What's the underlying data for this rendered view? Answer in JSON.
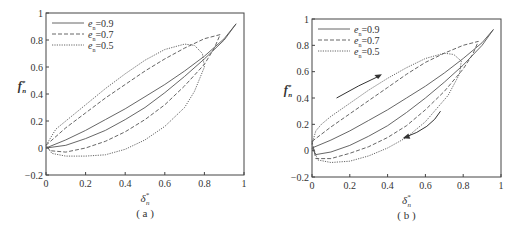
{
  "chart_data": [
    {
      "type": "line",
      "panel_label": "( a )",
      "xlabel": "δ*n",
      "ylabel": "f*n",
      "xlim": [
        0,
        1
      ],
      "ylim": [
        -0.2,
        1
      ],
      "xticks": [
        "0",
        "0.2",
        "0.4",
        "0.6",
        "0.8",
        "1"
      ],
      "yticks": [
        "-0.2",
        "0",
        "0.2",
        "0.4",
        "0.6",
        "0.8",
        "1"
      ],
      "legend_position": "upper left",
      "series": [
        {
          "name": "en=0.9",
          "style": "solid",
          "x": [
            0,
            0.1,
            0.2,
            0.3,
            0.4,
            0.5,
            0.6,
            0.7,
            0.8,
            0.9,
            0.96,
            0.9,
            0.8,
            0.7,
            0.6,
            0.5,
            0.4,
            0.3,
            0.2,
            0.1,
            0
          ],
          "y": [
            0,
            0.06,
            0.13,
            0.21,
            0.29,
            0.38,
            0.47,
            0.57,
            0.68,
            0.81,
            0.92,
            0.8,
            0.66,
            0.53,
            0.41,
            0.3,
            0.21,
            0.13,
            0.07,
            0.02,
            0
          ]
        },
        {
          "name": "en=0.7",
          "style": "dashed",
          "x": [
            0,
            0.1,
            0.2,
            0.3,
            0.4,
            0.5,
            0.6,
            0.7,
            0.8,
            0.88,
            0.85,
            0.8,
            0.7,
            0.6,
            0.5,
            0.4,
            0.3,
            0.2,
            0.1,
            0.02,
            0
          ],
          "y": [
            0.02,
            0.15,
            0.26,
            0.37,
            0.47,
            0.57,
            0.66,
            0.74,
            0.81,
            0.84,
            0.74,
            0.62,
            0.46,
            0.32,
            0.21,
            0.12,
            0.05,
            0,
            -0.03,
            -0.02,
            0.02
          ]
        },
        {
          "name": "en=0.5",
          "style": "dotted",
          "x": [
            0,
            0.05,
            0.1,
            0.2,
            0.3,
            0.4,
            0.5,
            0.6,
            0.7,
            0.75,
            0.79,
            0.8,
            0.75,
            0.7,
            0.6,
            0.5,
            0.4,
            0.3,
            0.2,
            0.1,
            0.03,
            0
          ],
          "y": [
            0.02,
            0.14,
            0.2,
            0.32,
            0.44,
            0.55,
            0.65,
            0.73,
            0.77,
            0.76,
            0.7,
            0.6,
            0.42,
            0.3,
            0.16,
            0.06,
            -0.01,
            -0.05,
            -0.06,
            -0.06,
            -0.04,
            0.02
          ]
        }
      ]
    },
    {
      "type": "line",
      "panel_label": "( b )",
      "xlabel": "δ*n",
      "ylabel": "f*n",
      "xlim": [
        0,
        1
      ],
      "ylim": [
        -0.2,
        1
      ],
      "xticks": [
        "0",
        "0.2",
        "0.4",
        "0.6",
        "0.8",
        "1"
      ],
      "yticks": [
        "-0.2",
        "0",
        "0.2",
        "0.4",
        "0.6",
        "0.8",
        "1"
      ],
      "legend_position": "upper left",
      "annotations": [
        "arrow up-right (loading)",
        "arrow down-left (unloading)"
      ],
      "series": [
        {
          "name": "en=0.9",
          "style": "solid",
          "x": [
            0,
            0.1,
            0.2,
            0.3,
            0.4,
            0.5,
            0.6,
            0.7,
            0.8,
            0.9,
            0.96,
            0.9,
            0.8,
            0.7,
            0.6,
            0.5,
            0.4,
            0.3,
            0.2,
            0.1,
            0.02,
            0
          ],
          "y": [
            0.02,
            0.08,
            0.15,
            0.23,
            0.31,
            0.4,
            0.49,
            0.59,
            0.7,
            0.82,
            0.92,
            0.8,
            0.65,
            0.52,
            0.4,
            0.29,
            0.19,
            0.11,
            0.04,
            -0.01,
            -0.03,
            0.02
          ]
        },
        {
          "name": "en=0.7",
          "style": "dashed",
          "x": [
            0,
            0.1,
            0.2,
            0.3,
            0.4,
            0.5,
            0.6,
            0.7,
            0.8,
            0.88,
            0.85,
            0.8,
            0.7,
            0.6,
            0.5,
            0.4,
            0.3,
            0.2,
            0.1,
            0.02,
            0
          ],
          "y": [
            0.07,
            0.18,
            0.28,
            0.38,
            0.48,
            0.58,
            0.67,
            0.74,
            0.8,
            0.83,
            0.73,
            0.62,
            0.45,
            0.31,
            0.19,
            0.1,
            0.03,
            -0.02,
            -0.06,
            -0.06,
            0.07
          ]
        },
        {
          "name": "en=0.5",
          "style": "dotted",
          "x": [
            0,
            0.02,
            0.05,
            0.1,
            0.2,
            0.3,
            0.4,
            0.5,
            0.6,
            0.7,
            0.75,
            0.79,
            0.78,
            0.72,
            0.6,
            0.5,
            0.4,
            0.3,
            0.2,
            0.1,
            0.03,
            0
          ],
          "y": [
            0.05,
            0.15,
            0.2,
            0.26,
            0.36,
            0.46,
            0.55,
            0.63,
            0.7,
            0.74,
            0.73,
            0.68,
            0.58,
            0.42,
            0.22,
            0.1,
            0.02,
            -0.04,
            -0.08,
            -0.09,
            -0.07,
            0.05
          ]
        }
      ]
    }
  ]
}
